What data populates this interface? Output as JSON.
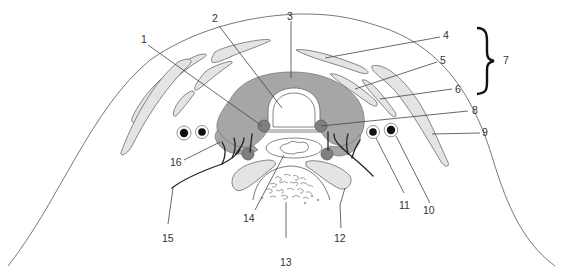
{
  "diagram": {
    "type": "anatomical-cross-section",
    "colors": {
      "gland": "#a6a6a6",
      "muscle": "#e4e4e4",
      "node": "#7f7f7f",
      "vessel": "#111111",
      "outline": "#555555",
      "label": "#333333"
    },
    "labels": [
      {
        "id": "1",
        "text": "1"
      },
      {
        "id": "2",
        "text": "2"
      },
      {
        "id": "3",
        "text": "3"
      },
      {
        "id": "4",
        "text": "4"
      },
      {
        "id": "5",
        "text": "5"
      },
      {
        "id": "6",
        "text": "6"
      },
      {
        "id": "7",
        "text": "7"
      },
      {
        "id": "8",
        "text": "8"
      },
      {
        "id": "9",
        "text": "9"
      },
      {
        "id": "10",
        "text": "10"
      },
      {
        "id": "11",
        "text": "11"
      },
      {
        "id": "12",
        "text": "12"
      },
      {
        "id": "13",
        "text": "13"
      },
      {
        "id": "14",
        "text": "14"
      },
      {
        "id": "15",
        "text": "15"
      },
      {
        "id": "16",
        "text": "16"
      }
    ],
    "bracket": {
      "symbol": "}",
      "groups_labels": [
        "4",
        "5",
        "6"
      ],
      "group_label": "7"
    }
  }
}
